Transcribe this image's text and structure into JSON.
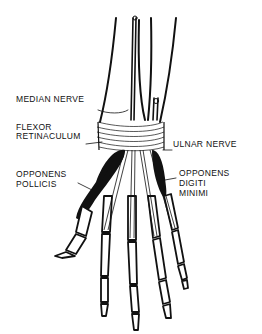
{
  "diagram": {
    "labels": {
      "median_nerve": "MEDIAN NERVE",
      "flexor_line1": "FLEXOR",
      "flexor_line2": "RETINACULUM",
      "ulnar_nerve": "ULNAR NERVE",
      "op_line1": "OPPONENS",
      "op_line2": "POLLICIS",
      "odm_line1": "OPPONENS",
      "odm_line2": "DIGITI",
      "odm_line3": "MINIMI"
    },
    "colors": {
      "ink": "#111111",
      "background": "#ffffff"
    }
  }
}
